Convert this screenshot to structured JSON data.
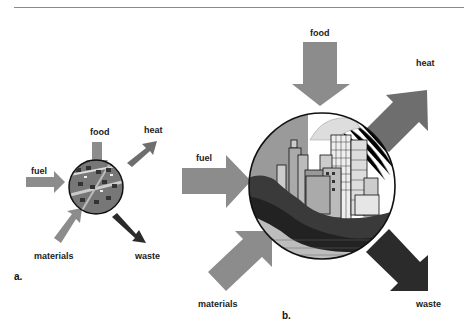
{
  "figure": {
    "panel_a": {
      "label": "a.",
      "inputs": [
        "food",
        "fuel",
        "materials"
      ],
      "outputs": [
        "heat",
        "waste"
      ],
      "labels": {
        "food": "food",
        "fuel": "fuel",
        "materials": "materials",
        "heat": "heat",
        "waste": "waste"
      }
    },
    "panel_b": {
      "label": "b.",
      "inputs": [
        "food",
        "fuel",
        "materials"
      ],
      "outputs": [
        "heat",
        "waste"
      ],
      "labels": {
        "food": "food",
        "fuel": "fuel",
        "materials": "materials",
        "heat": "heat",
        "waste": "waste"
      }
    },
    "colors": {
      "input_arrow": "#8c8c8c",
      "heat_arrow": "#6e6e6e",
      "waste_arrow": "#2b2b2b",
      "rule": "#8a8a8a"
    }
  }
}
